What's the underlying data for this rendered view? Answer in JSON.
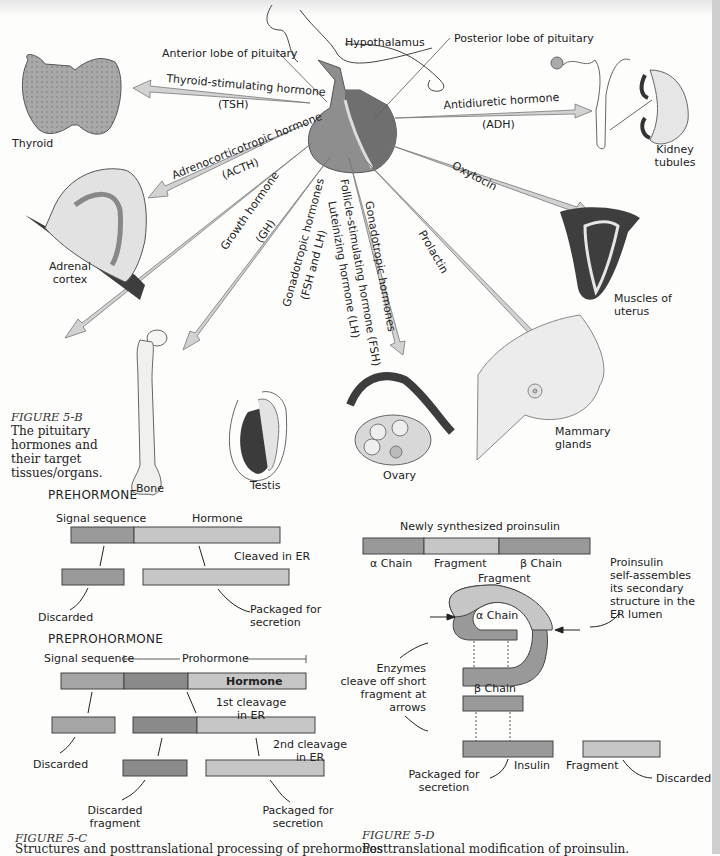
{
  "figure_5b": {
    "caption_title": "FIGURE 5-B",
    "caption_lines": [
      "The pituitary",
      "hormones and",
      "their target",
      "tissues/organs."
    ],
    "labels": {
      "hypothalamus": "Hypothalamus",
      "anterior_lobe": "Anterior lobe of pituitary",
      "posterior_lobe": "Posterior lobe of pituitary"
    },
    "hormones": [
      {
        "name": "Thyroid-stimulating hormone",
        "abbr": "(TSH)",
        "target": "Thyroid"
      },
      {
        "name": "Adrenocorticotropic hormone",
        "abbr": "(ACTH)",
        "target": "Adrenal cortex"
      },
      {
        "name": "Growth hormone",
        "abbr": "(GH)",
        "target": "Bone"
      },
      {
        "name": "Gonadotropic hormones",
        "abbr": "(FSH and LH)",
        "target": "Testis"
      },
      {
        "name": "Follicle-stimulating hormone (FSH)",
        "abbr": "Luteinizing hormone (LH)",
        "extra": "Gonadotropic hormones",
        "target": "Ovary"
      },
      {
        "name": "Prolactin",
        "abbr": "",
        "target": "Mammary glands"
      },
      {
        "name": "Oxytocin",
        "abbr": "",
        "target": "Muscles of uterus"
      },
      {
        "name": "Antidiuretic hormone",
        "abbr": "(ADH)",
        "target": "Kidney tubules"
      }
    ],
    "targets": {
      "thyroid": "Thyroid",
      "adrenal_1": "Adrenal",
      "adrenal_2": "cortex",
      "bone": "Bone",
      "testis": "Testis",
      "ovary": "Ovary",
      "mammary_1": "Mammary",
      "mammary_2": "glands",
      "uterus_1": "Muscles of",
      "uterus_2": "uterus",
      "kidney_1": "Kidney",
      "kidney_2": "tubules"
    }
  },
  "figure_5c": {
    "caption_title": "FIGURE 5-C",
    "caption_text": "Structures and posttranslational processing of prehormones",
    "prehormone": {
      "heading": "PREHORMONE",
      "signal_sequence": "Signal sequence",
      "hormone": "Hormone",
      "cleaved": "Cleaved in ER",
      "discarded": "Discarded",
      "packaged_1": "Packaged for",
      "packaged_2": "secretion"
    },
    "preprohormone": {
      "heading": "PREPROHORMONE",
      "signal_sequence": "Signal sequence",
      "prohormone": "Prohormone",
      "hormone": "Hormone",
      "first_cleavage_1": "1st cleavage",
      "first_cleavage_2": "in ER",
      "second_cleavage_1": "2nd cleavage",
      "second_cleavage_2": "in ER",
      "discarded": "Discarded",
      "discarded_fragment_1": "Discarded",
      "discarded_fragment_2": "fragment",
      "packaged_1": "Packaged for",
      "packaged_2": "secretion"
    }
  },
  "figure_5d": {
    "caption_title": "FIGURE 5-D",
    "caption_text": "Posttranslational modification of proinsulin.",
    "title": "Newly synthesized proinsulin",
    "segments": [
      "α Chain",
      "Fragment",
      "β Chain"
    ],
    "fragment_label": "Fragment",
    "alpha_label": "α Chain",
    "beta_label": "β Chain",
    "note_right": [
      "Proinsulin",
      "self-assembles",
      "its secondary",
      "structure in the",
      "ER lumen"
    ],
    "note_left": [
      "Enzymes",
      "cleave off short",
      "fragment at",
      "arrows"
    ],
    "insulin": "Insulin",
    "fragment_out": "Fragment",
    "discarded": "Discarded",
    "packaged_1": "Packaged for",
    "packaged_2": "secretion",
    "ss": "S"
  },
  "colors": {
    "dark_bar": "#8a8a8a",
    "mid_bar": "#a3a3a3",
    "light_bar": "#c4c4c4",
    "arrow_fill": "#d2d2d2",
    "organ_dark": "#4a4a4a"
  }
}
